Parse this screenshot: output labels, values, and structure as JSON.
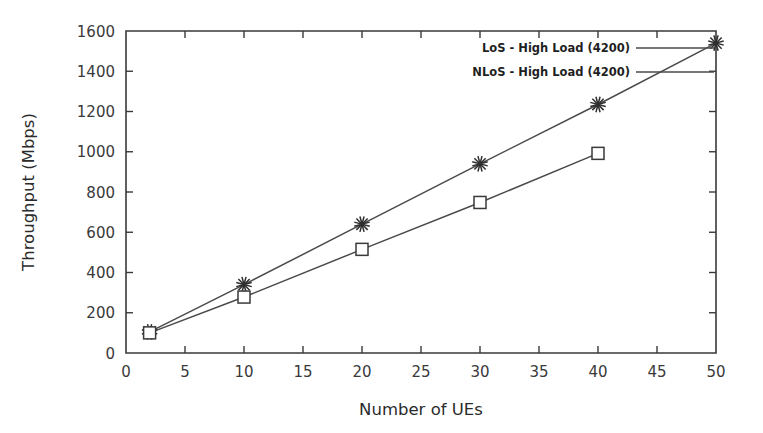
{
  "chart_data": {
    "type": "line",
    "title": "",
    "xlabel": "Number of UEs",
    "ylabel": "Throughput (Mbps)",
    "xlim": [
      0,
      50
    ],
    "ylim": [
      0,
      1600
    ],
    "xticks": [
      0,
      5,
      10,
      15,
      20,
      25,
      30,
      35,
      40,
      45,
      50
    ],
    "xticklabels": [
      "0",
      "5",
      "10",
      "15",
      "20",
      "25",
      "30",
      "35",
      "40",
      "45",
      "50"
    ],
    "yticks": [
      0,
      200,
      400,
      600,
      800,
      1000,
      1200,
      1400,
      1600
    ],
    "yticklabels": [
      "0",
      "200",
      "400",
      "600",
      "800",
      "1000",
      "1200",
      "1400",
      "1600"
    ],
    "grid": false,
    "legend_position": "upper right",
    "series": [
      {
        "name": "LoS - High Load (4200)",
        "marker": "star",
        "color": "#3a3a3a",
        "x": [
          2,
          10,
          20,
          30,
          40,
          50
        ],
        "values": [
          105,
          340,
          640,
          940,
          1235,
          1540
        ]
      },
      {
        "name": "NLoS - High Load (4200)",
        "marker": "square",
        "color": "#3a3a3a",
        "x": [
          2,
          10,
          20,
          30,
          40
        ],
        "values": [
          100,
          278,
          515,
          748,
          992
        ]
      }
    ]
  },
  "legend": {
    "entries": [
      {
        "label": "LoS - High Load (4200)"
      },
      {
        "label": "NLoS - High Load (4200)"
      }
    ]
  },
  "figure": {
    "background": "#ffffff",
    "axis_color": "#3a3a3a"
  }
}
